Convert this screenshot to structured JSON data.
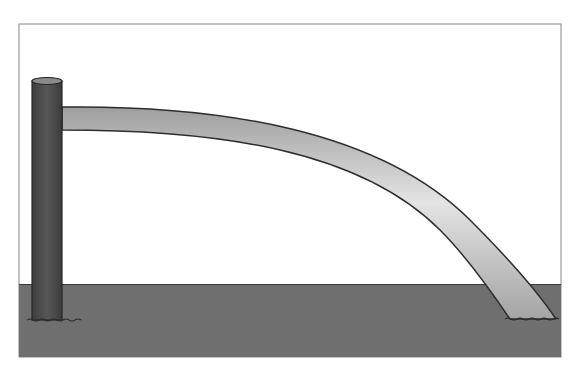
{
  "scene": {
    "description": "Cantilever beam fixed to a vertical post, bending down to touch the ground",
    "colors": {
      "background": "#ffffff",
      "frame": "#9a9a9a",
      "ground": "#6f6f6f",
      "ground_line": "#3a3a3a",
      "post": "#4a4a4a",
      "post_top": "#8a8a8a",
      "beam_light": "#e2e2e2",
      "beam_dark": "#a8a8a8",
      "outline": "#2e2e2e"
    }
  },
  "elements": {
    "post": {
      "label": ""
    },
    "beam": {
      "label": ""
    },
    "ground": {
      "label": ""
    }
  }
}
